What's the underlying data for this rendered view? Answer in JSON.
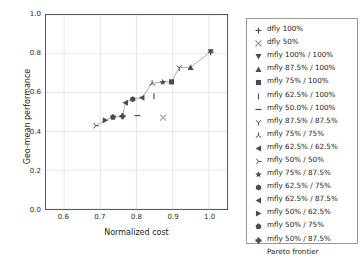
{
  "chart_data": {
    "type": "scatter",
    "title": "",
    "xlabel": "Normalized cost",
    "ylabel": "Geo-mean performance",
    "xlim": [
      0.55,
      1.05
    ],
    "ylim": [
      0.0,
      1.0
    ],
    "xticks": [
      "0.6",
      "0.7",
      "0.8",
      "0.9",
      "1.0"
    ],
    "xtick_values": [
      0.6,
      0.7,
      0.8,
      0.9,
      1.0
    ],
    "yticks": [
      "0.0",
      "0.2",
      "0.4",
      "0.6",
      "0.8",
      "1.0"
    ],
    "ytick_values": [
      0.0,
      0.2,
      0.4,
      0.6,
      0.8,
      1.0
    ],
    "grid": true,
    "legend_position": "outside-right",
    "marker_color": "#4a4a56",
    "line_color": "#b0b0b8",
    "series": [
      {
        "name": "dfly 100%",
        "marker": "plus",
        "x": [
          1.0
        ],
        "y": [
          0.81
        ]
      },
      {
        "name": "dfly 50%",
        "marker": "x",
        "x": [
          0.87
        ],
        "y": [
          0.476
        ]
      },
      {
        "name": "mfly 100% / 100%",
        "marker": "triangle-down",
        "x": [
          1.0
        ],
        "y": [
          0.812
        ]
      },
      {
        "name": "mfly 87.5% / 100%",
        "marker": "triangle-up",
        "x": [
          0.945
        ],
        "y": [
          0.733
        ]
      },
      {
        "name": "mfly 75% / 100%",
        "marker": "square",
        "x": [
          0.893
        ],
        "y": [
          0.659
        ]
      },
      {
        "name": "mfly 62.5% / 100%",
        "marker": "vline",
        "x": [
          0.845
        ],
        "y": [
          0.585
        ]
      },
      {
        "name": "mfly 50.0% / 100%",
        "marker": "hline",
        "x": [
          0.8
        ],
        "y": [
          0.487
        ]
      },
      {
        "name": "mfly 87.5% / 87.5%",
        "marker": "tri-down",
        "x": [
          0.914
        ],
        "y": [
          0.731
        ]
      },
      {
        "name": "mfly 75% / 75%",
        "marker": "tri-up",
        "x": [
          0.84
        ],
        "y": [
          0.652
        ]
      },
      {
        "name": "mfly 62.5% / 62.5%",
        "marker": "triangle-left",
        "x": [
          0.812
        ],
        "y": [
          0.578
        ]
      },
      {
        "name": "mfly 50% / 50%",
        "marker": "tri-right",
        "x": [
          0.686
        ],
        "y": [
          0.435
        ]
      },
      {
        "name": "mfly 75% / 87.5%",
        "marker": "star",
        "x": [
          0.869
        ],
        "y": [
          0.657
        ]
      },
      {
        "name": "mfly 62.5% / 75%",
        "marker": "hexagon",
        "x": [
          0.787
        ],
        "y": [
          0.57
        ]
      },
      {
        "name": "mfly 62.5% / 87.5%",
        "marker": "triangle-left-f",
        "x": [
          0.767
        ],
        "y": [
          0.552
        ]
      },
      {
        "name": "mfly 50% / 62.5%",
        "marker": "triangle-right-f",
        "x": [
          0.712
        ],
        "y": [
          0.463
        ]
      },
      {
        "name": "mfly 50% / 75%",
        "marker": "pentagon",
        "x": [
          0.733
        ],
        "y": [
          0.479
        ]
      },
      {
        "name": "mfly 50% / 87.5%",
        "marker": "plus-filled",
        "x": [
          0.759
        ],
        "y": [
          0.483
        ]
      },
      {
        "name": "Pareto frontier",
        "marker": "line",
        "x": [
          0.686,
          0.712,
          0.733,
          0.759,
          0.767,
          0.787,
          0.812,
          0.84,
          0.869,
          0.893,
          0.914,
          0.945,
          1.0
        ],
        "y": [
          0.435,
          0.463,
          0.479,
          0.483,
          0.552,
          0.57,
          0.578,
          0.652,
          0.657,
          0.659,
          0.731,
          0.733,
          0.812
        ]
      }
    ]
  },
  "legend": {
    "entries": [
      {
        "label": "dfly 100%",
        "marker": "plus"
      },
      {
        "label": "dfly 50%",
        "marker": "x"
      },
      {
        "label": "mfly 100% / 100%",
        "marker": "triangle-down"
      },
      {
        "label": "mfly 87.5% / 100%",
        "marker": "triangle-up"
      },
      {
        "label": "mfly 75% / 100%",
        "marker": "square"
      },
      {
        "label": "mfly 62.5% / 100%",
        "marker": "vline"
      },
      {
        "label": "mfly 50.0% / 100%",
        "marker": "hline"
      },
      {
        "label": "mfly 87.5% / 87.5%",
        "marker": "tri-down"
      },
      {
        "label": "mfly 75% / 75%",
        "marker": "tri-up"
      },
      {
        "label": "mfly 62.5% / 62.5%",
        "marker": "triangle-left"
      },
      {
        "label": "mfly 50% / 50%",
        "marker": "tri-right"
      },
      {
        "label": "mfly 75% / 87.5%",
        "marker": "star"
      },
      {
        "label": "mfly 62.5% / 75%",
        "marker": "hexagon"
      },
      {
        "label": "mfly 62.5% / 87.5%",
        "marker": "triangle-left-f"
      },
      {
        "label": "mfly 50% / 62.5%",
        "marker": "triangle-right-f"
      },
      {
        "label": "mfly 50% / 75%",
        "marker": "pentagon"
      },
      {
        "label": "mfly 50% / 87.5%",
        "marker": "plus-filled"
      },
      {
        "label": "Pareto frontier",
        "marker": "line"
      }
    ]
  }
}
